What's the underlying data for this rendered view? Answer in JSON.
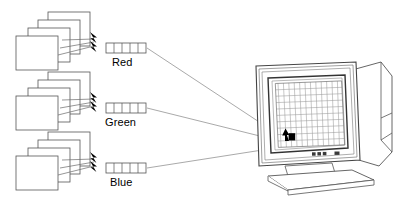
{
  "figure": {
    "type": "schematic-diagram",
    "background_color": "#ffffff",
    "line_color": "#4d4d4d",
    "accent_color": "#000000"
  },
  "channels": [
    {
      "id": "red",
      "label": "Red",
      "plane_count": 4,
      "register_cells": 5,
      "arrow_count": 2,
      "beam_line_count": 3
    },
    {
      "id": "green",
      "label": "Green",
      "plane_count": 4,
      "register_cells": 5,
      "arrow_count": 2,
      "beam_line_count": 3
    },
    {
      "id": "blue",
      "label": "Blue",
      "plane_count": 4,
      "register_cells": 5,
      "arrow_count": 2,
      "beam_line_count": 3
    }
  ],
  "monitor": {
    "name": "crt-monitor",
    "screen": {
      "grid_columns": 12,
      "grid_rows": 10,
      "lit_pixel": {
        "column": 2,
        "row": 9,
        "fill": "#000000"
      }
    },
    "controls": {
      "button_count": 4
    }
  },
  "connectors": {
    "count": 3,
    "description": "thin lines from each colour register to the lit pixel"
  }
}
